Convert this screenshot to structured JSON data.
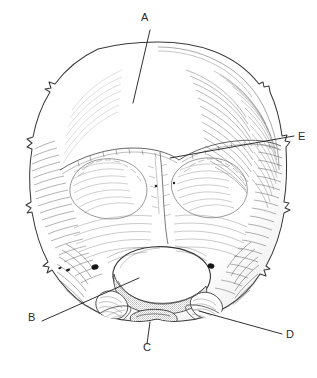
{
  "figure": {
    "type": "anatomical-line-drawing",
    "background_color": "#ffffff",
    "ink_color": "#3a3a3a",
    "leader_line_color": "#262626",
    "width": 317,
    "height": 378
  },
  "labels": [
    {
      "id": "A",
      "text": "A",
      "x": 145,
      "y": 17,
      "leader": {
        "x1": 150,
        "y1": 30,
        "x2": 133,
        "y2": 103
      },
      "target": "occipital-squama"
    },
    {
      "id": "B",
      "text": "B",
      "x": 31,
      "y": 317,
      "leader": {
        "x1": 42,
        "y1": 321,
        "x2": 139,
        "y2": 278
      },
      "target": "occipital-condyle-left"
    },
    {
      "id": "C",
      "text": "C",
      "x": 145,
      "y": 347,
      "leader": {
        "x1": 150,
        "y1": 322,
        "x2": 147,
        "y2": 344
      },
      "target": "basilar-part"
    },
    {
      "id": "D",
      "text": "D",
      "x": 285,
      "y": 328,
      "leader": {
        "x1": 282,
        "y1": 334,
        "x2": 199,
        "y2": 311
      },
      "target": "jugular-process"
    },
    {
      "id": "E",
      "text": "E",
      "x": 297,
      "y": 130,
      "leader": {
        "x1": 294,
        "y1": 136,
        "x2": 170,
        "y2": 158
      },
      "target": "lambdoid-suture"
    }
  ],
  "structures": {
    "cranial_vault": "occipital squama",
    "aperture": "foramen magnum",
    "paired_processes": "occipital condyles",
    "suture": "lambdoid suture"
  }
}
